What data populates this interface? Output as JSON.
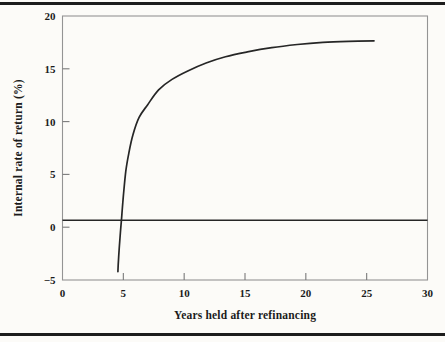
{
  "figure": {
    "background": "#fcfbf8",
    "rule_color": "#1d1d1d",
    "frame_color": "#949494",
    "tick_color": "#7a7a7a",
    "curve_color": "#262626",
    "text_color": "#1b1b1b"
  },
  "chart_data": {
    "type": "line",
    "title": "",
    "xlabel": "Years held after refinancing",
    "ylabel": "Internal rate of return (%)",
    "xlim": [
      0,
      30
    ],
    "ylim": [
      -5,
      20
    ],
    "x_ticks": [
      0,
      5,
      10,
      15,
      20,
      25,
      30
    ],
    "y_ticks": [
      -5,
      0,
      5,
      10,
      15,
      20
    ],
    "grid": false,
    "legend": false,
    "frame": "full-box",
    "series": [
      {
        "name": "IRR after refinancing",
        "type": "curve",
        "points": [
          [
            4.55,
            -4.2
          ],
          [
            4.6,
            -3.1
          ],
          [
            4.67,
            -1.9
          ],
          [
            4.76,
            -0.5
          ],
          [
            4.87,
            1.1
          ],
          [
            5.0,
            2.9
          ],
          [
            5.2,
            5.3
          ],
          [
            5.45,
            7.0
          ],
          [
            5.8,
            8.8
          ],
          [
            6.3,
            10.4
          ],
          [
            7.0,
            11.6
          ],
          [
            7.9,
            13.0
          ],
          [
            9.0,
            14.0
          ],
          [
            10.3,
            14.8
          ],
          [
            11.8,
            15.55
          ],
          [
            13.4,
            16.15
          ],
          [
            15.2,
            16.6
          ],
          [
            17.2,
            17.0
          ],
          [
            19.3,
            17.3
          ],
          [
            21.4,
            17.5
          ],
          [
            23.5,
            17.6
          ],
          [
            25.6,
            17.65
          ]
        ]
      },
      {
        "name": "zero-return baseline",
        "type": "hline",
        "y": 0.65,
        "x_start": 0,
        "x_end": 30
      }
    ]
  }
}
